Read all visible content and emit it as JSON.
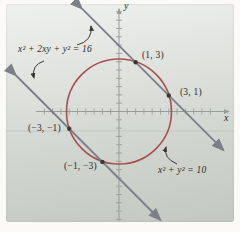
{
  "figure": {
    "axis_x_label": "x",
    "axis_y_label": "y",
    "line_equation_label": "x² + 2xy + y² = 16",
    "circle_equation_label": "x² + y² = 10",
    "points": [
      {
        "label": "(1, 3)",
        "x": 1,
        "y": 3
      },
      {
        "label": "(3, 1)",
        "x": 3,
        "y": 1
      },
      {
        "label": "(−3, −1)",
        "x": -3,
        "y": -1
      },
      {
        "label": "(−1, −3)",
        "x": -1,
        "y": -3
      }
    ],
    "colors": {
      "circle": "#a85050",
      "line": "#7b7f89",
      "axis": "#989d97",
      "text": "#2e2c28",
      "panel_top": "#eff1ee",
      "panel_bottom": "#c3c8c1"
    }
  }
}
